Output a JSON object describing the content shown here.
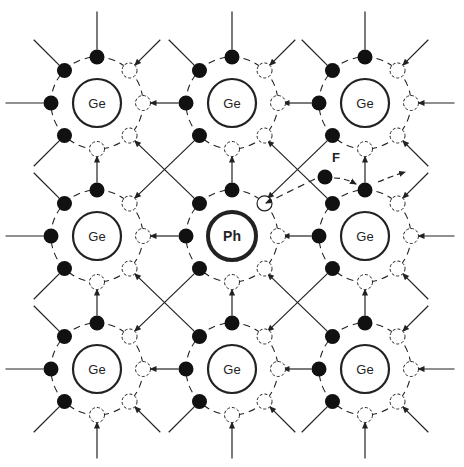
{
  "diagram": {
    "colors": {
      "line": "#222222",
      "electron": "#111111",
      "background": "#ffffff"
    },
    "atoms": [
      {
        "label": "Ge",
        "cx": 97,
        "cy": 103
      },
      {
        "label": "Ge",
        "cx": 232,
        "cy": 103
      },
      {
        "label": "Ge",
        "cx": 365,
        "cy": 103
      },
      {
        "label": "Ge",
        "cx": 97,
        "cy": 236
      },
      {
        "label": "Ph",
        "cx": 232,
        "cy": 236,
        "impurity": true
      },
      {
        "label": "Ge",
        "cx": 365,
        "cy": 236
      },
      {
        "label": "Ge",
        "cx": 97,
        "cy": 369
      },
      {
        "label": "Ge",
        "cx": 232,
        "cy": 369
      },
      {
        "label": "Ge",
        "cx": 365,
        "cy": 369
      }
    ],
    "free_electron": {
      "label": "F",
      "x": 325,
      "y": 177,
      "label_x": 336,
      "label_y": 162
    },
    "legend": []
  }
}
